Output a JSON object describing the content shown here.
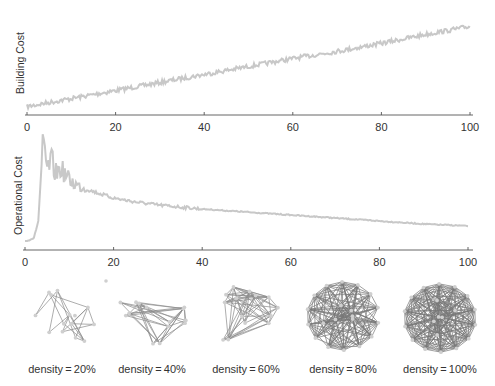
{
  "chart_data": [
    {
      "type": "line",
      "title": "",
      "xlabel": "",
      "ylabel": "Building Cost",
      "xlim": [
        0,
        100
      ],
      "ylim": [
        0,
        1
      ],
      "xticks": [
        0,
        20,
        40,
        60,
        80,
        100
      ],
      "yticks": [],
      "grid": false,
      "color": "#c8c8c8",
      "series": [
        {
          "name": "Building Cost",
          "trend": "linear increasing with small noise",
          "x": [
            0,
            10,
            20,
            30,
            40,
            50,
            60,
            70,
            80,
            90,
            100
          ],
          "values": [
            0.05,
            0.14,
            0.23,
            0.32,
            0.41,
            0.5,
            0.59,
            0.67,
            0.76,
            0.86,
            0.95
          ]
        }
      ]
    },
    {
      "type": "line",
      "title": "",
      "xlabel": "",
      "ylabel": "Operational Cost",
      "xlim": [
        0,
        100
      ],
      "ylim": [
        0,
        1
      ],
      "xticks": [
        0,
        20,
        40,
        60,
        80,
        100
      ],
      "yticks": [],
      "grid": false,
      "color": "#c8c8c8",
      "series": [
        {
          "name": "Operational Cost",
          "trend": "near zero until ~3, sharp noisy peak near 4-8, then smooth decay",
          "x": [
            0,
            1,
            2,
            3,
            4,
            5,
            6,
            7,
            8,
            10,
            12,
            15,
            20,
            25,
            30,
            40,
            50,
            60,
            70,
            80,
            90,
            100
          ],
          "values": [
            0.05,
            0.06,
            0.08,
            0.25,
            1.0,
            0.75,
            0.85,
            0.72,
            0.78,
            0.66,
            0.6,
            0.55,
            0.48,
            0.44,
            0.41,
            0.37,
            0.34,
            0.31,
            0.28,
            0.25,
            0.22,
            0.2
          ]
        }
      ]
    }
  ],
  "networks": [
    {
      "label": "density = 20%",
      "density": 0.2,
      "nodes": 14
    },
    {
      "label": "density = 40%",
      "density": 0.4,
      "nodes": 14
    },
    {
      "label": "density = 60%",
      "density": 0.6,
      "nodes": 14
    },
    {
      "label": "density = 80%",
      "density": 0.8,
      "nodes": 14
    },
    {
      "label": "density = 100%",
      "density": 1.0,
      "nodes": 14
    }
  ]
}
